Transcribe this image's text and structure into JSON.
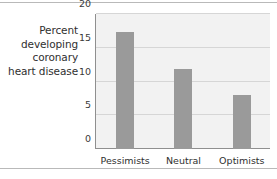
{
  "chart_data": {
    "type": "bar",
    "title": "",
    "xlabel": "",
    "ylabel": "Percent developing coronary heart disease",
    "ylabel_lines": [
      "Percent",
      "developing",
      "coronary",
      "heart disease"
    ],
    "categories": [
      "Pessimists",
      "Neutral",
      "Optimists"
    ],
    "values": [
      17.3,
      11.8,
      8.0
    ],
    "ylim": [
      0,
      20
    ],
    "yticks": [
      0,
      5,
      10,
      15,
      20
    ],
    "ytick_labels": [
      "0",
      "5",
      "10",
      "15",
      "20"
    ],
    "grid": true,
    "legend": "none",
    "bar_color": "#9a9a9a",
    "plot_background": "#f2f2f2",
    "axis_color": "#8f8f8f",
    "gridline_color": "#d6d6d6",
    "text_color": "#2f2f2f"
  }
}
